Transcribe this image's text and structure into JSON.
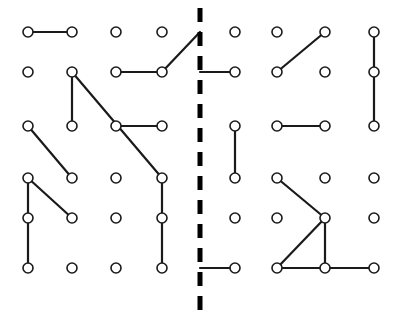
{
  "canvas": {
    "width": 397,
    "height": 318,
    "background": "#ffffff",
    "title": "Node Grid Diagram"
  },
  "style": {
    "node_fill": "#ffffff",
    "node_stroke": "#1a1a1a",
    "node_radius": 5,
    "node_stroke_width": 1.6,
    "edge_stroke": "#1a1a1a",
    "edge_stroke_width": 2.2,
    "divider_stroke": "#000000",
    "divider_stroke_width": 5,
    "divider_dash": "14 10"
  },
  "grid": {
    "columns_x": [
      28,
      72,
      116,
      162,
      235,
      277,
      325,
      374
    ],
    "rows_y": [
      32,
      72,
      126,
      178,
      218,
      268
    ],
    "column_count": 8,
    "row_count": 6
  },
  "divider": {
    "name": "vertical-dashed-divider",
    "x": 200,
    "y_top": 8,
    "y_bottom": 310,
    "orientation": "vertical",
    "style": "dashed"
  },
  "nodes": [
    {
      "id": "r1c1",
      "col": 0,
      "row": 0,
      "x": 28,
      "y": 32
    },
    {
      "id": "r1c2",
      "col": 1,
      "row": 0,
      "x": 72,
      "y": 32
    },
    {
      "id": "r1c3",
      "col": 2,
      "row": 0,
      "x": 116,
      "y": 32
    },
    {
      "id": "r1c4",
      "col": 3,
      "row": 0,
      "x": 162,
      "y": 32
    },
    {
      "id": "r1c5",
      "col": 4,
      "row": 0,
      "x": 235,
      "y": 32
    },
    {
      "id": "r1c6",
      "col": 5,
      "row": 0,
      "x": 277,
      "y": 32
    },
    {
      "id": "r1c7",
      "col": 6,
      "row": 0,
      "x": 325,
      "y": 32
    },
    {
      "id": "r1c8",
      "col": 7,
      "row": 0,
      "x": 374,
      "y": 32
    },
    {
      "id": "r2c1",
      "col": 0,
      "row": 1,
      "x": 28,
      "y": 72
    },
    {
      "id": "r2c2",
      "col": 1,
      "row": 1,
      "x": 72,
      "y": 72
    },
    {
      "id": "r2c3",
      "col": 2,
      "row": 1,
      "x": 116,
      "y": 72
    },
    {
      "id": "r2c4",
      "col": 3,
      "row": 1,
      "x": 162,
      "y": 72
    },
    {
      "id": "r2c5",
      "col": 4,
      "row": 1,
      "x": 235,
      "y": 72
    },
    {
      "id": "r2c6",
      "col": 5,
      "row": 1,
      "x": 277,
      "y": 72
    },
    {
      "id": "r2c7",
      "col": 6,
      "row": 1,
      "x": 325,
      "y": 72
    },
    {
      "id": "r2c8",
      "col": 7,
      "row": 1,
      "x": 374,
      "y": 72
    },
    {
      "id": "r3c1",
      "col": 0,
      "row": 2,
      "x": 28,
      "y": 126
    },
    {
      "id": "r3c2",
      "col": 1,
      "row": 2,
      "x": 72,
      "y": 126
    },
    {
      "id": "r3c3",
      "col": 2,
      "row": 2,
      "x": 116,
      "y": 126
    },
    {
      "id": "r3c4",
      "col": 3,
      "row": 2,
      "x": 162,
      "y": 126
    },
    {
      "id": "r3c5",
      "col": 4,
      "row": 2,
      "x": 235,
      "y": 126
    },
    {
      "id": "r3c6",
      "col": 5,
      "row": 2,
      "x": 277,
      "y": 126
    },
    {
      "id": "r3c7",
      "col": 6,
      "row": 2,
      "x": 325,
      "y": 126
    },
    {
      "id": "r3c8",
      "col": 7,
      "row": 2,
      "x": 374,
      "y": 126
    },
    {
      "id": "r4c1",
      "col": 0,
      "row": 3,
      "x": 28,
      "y": 178
    },
    {
      "id": "r4c2",
      "col": 1,
      "row": 3,
      "x": 72,
      "y": 178
    },
    {
      "id": "r4c3",
      "col": 2,
      "row": 3,
      "x": 116,
      "y": 178
    },
    {
      "id": "r4c4",
      "col": 3,
      "row": 3,
      "x": 162,
      "y": 178
    },
    {
      "id": "r4c5",
      "col": 4,
      "row": 3,
      "x": 235,
      "y": 178
    },
    {
      "id": "r4c6",
      "col": 5,
      "row": 3,
      "x": 277,
      "y": 178
    },
    {
      "id": "r4c7",
      "col": 6,
      "row": 3,
      "x": 325,
      "y": 178
    },
    {
      "id": "r4c8",
      "col": 7,
      "row": 3,
      "x": 374,
      "y": 178
    },
    {
      "id": "r5c1",
      "col": 0,
      "row": 4,
      "x": 28,
      "y": 218
    },
    {
      "id": "r5c2",
      "col": 1,
      "row": 4,
      "x": 72,
      "y": 218
    },
    {
      "id": "r5c3",
      "col": 2,
      "row": 4,
      "x": 116,
      "y": 218
    },
    {
      "id": "r5c4",
      "col": 3,
      "row": 4,
      "x": 162,
      "y": 218
    },
    {
      "id": "r5c5",
      "col": 4,
      "row": 4,
      "x": 235,
      "y": 218
    },
    {
      "id": "r5c6",
      "col": 5,
      "row": 4,
      "x": 277,
      "y": 218
    },
    {
      "id": "r5c7",
      "col": 6,
      "row": 4,
      "x": 325,
      "y": 218
    },
    {
      "id": "r5c8",
      "col": 7,
      "row": 4,
      "x": 374,
      "y": 218
    },
    {
      "id": "r6c1",
      "col": 0,
      "row": 5,
      "x": 28,
      "y": 268
    },
    {
      "id": "r6c2",
      "col": 1,
      "row": 5,
      "x": 72,
      "y": 268
    },
    {
      "id": "r6c3",
      "col": 2,
      "row": 5,
      "x": 116,
      "y": 268
    },
    {
      "id": "r6c4",
      "col": 3,
      "row": 5,
      "x": 162,
      "y": 268
    },
    {
      "id": "r6c5",
      "col": 4,
      "row": 5,
      "x": 235,
      "y": 268
    },
    {
      "id": "r6c6",
      "col": 5,
      "row": 5,
      "x": 277,
      "y": 268
    },
    {
      "id": "r6c7",
      "col": 6,
      "row": 5,
      "x": 325,
      "y": 268
    },
    {
      "id": "r6c8",
      "col": 7,
      "row": 5,
      "x": 374,
      "y": 268
    }
  ],
  "edges": [
    {
      "id": "e1",
      "from": "r1c1",
      "to": "r1c2",
      "x1": 28,
      "y1": 32,
      "x2": 72,
      "y2": 32,
      "kind": "horizontal"
    },
    {
      "id": "e2",
      "from": "r2c3",
      "to": "r2c4",
      "x1": 116,
      "y1": 72,
      "x2": 162,
      "y2": 72,
      "kind": "horizontal"
    },
    {
      "id": "e3",
      "from": "r2c4",
      "to": "divider",
      "x1": 162,
      "y1": 72,
      "x2": 200,
      "y2": 32,
      "kind": "diagonal-up"
    },
    {
      "id": "e4",
      "from": "divider",
      "to": "r2c5",
      "x1": 200,
      "y1": 72,
      "x2": 235,
      "y2": 72,
      "kind": "horizontal"
    },
    {
      "id": "e5",
      "from": "r1c7",
      "to": "r2c6",
      "x1": 325,
      "y1": 32,
      "x2": 277,
      "y2": 72,
      "kind": "diagonal-down"
    },
    {
      "id": "e6",
      "from": "r1c8",
      "to": "r2c8",
      "x1": 374,
      "y1": 32,
      "x2": 374,
      "y2": 72,
      "kind": "vertical"
    },
    {
      "id": "e7",
      "from": "r2c8",
      "to": "r3c8",
      "x1": 374,
      "y1": 72,
      "x2": 374,
      "y2": 126,
      "kind": "vertical"
    },
    {
      "id": "e8",
      "from": "r2c2",
      "to": "r3c2",
      "x1": 72,
      "y1": 72,
      "x2": 72,
      "y2": 126,
      "kind": "vertical"
    },
    {
      "id": "e9",
      "from": "r2c2",
      "to": "r4c4",
      "x1": 72,
      "y1": 72,
      "x2": 162,
      "y2": 178,
      "kind": "diagonal-down-long"
    },
    {
      "id": "e10",
      "from": "r3c3",
      "to": "r3c4",
      "x1": 116,
      "y1": 126,
      "x2": 162,
      "y2": 126,
      "kind": "horizontal"
    },
    {
      "id": "e11",
      "from": "r3c1",
      "to": "r4c2",
      "x1": 28,
      "y1": 126,
      "x2": 72,
      "y2": 178,
      "kind": "diagonal-down"
    },
    {
      "id": "e12",
      "from": "r3c5",
      "to": "r4c5",
      "x1": 235,
      "y1": 126,
      "x2": 235,
      "y2": 178,
      "kind": "vertical"
    },
    {
      "id": "e13",
      "from": "r3c6",
      "to": "r3c7",
      "x1": 277,
      "y1": 126,
      "x2": 325,
      "y2": 126,
      "kind": "horizontal"
    },
    {
      "id": "e14",
      "from": "r4c1",
      "to": "r5c2",
      "x1": 28,
      "y1": 178,
      "x2": 72,
      "y2": 218,
      "kind": "diagonal-down"
    },
    {
      "id": "e15",
      "from": "r4c1",
      "to": "r5c1",
      "x1": 28,
      "y1": 178,
      "x2": 28,
      "y2": 218,
      "kind": "vertical"
    },
    {
      "id": "e16",
      "from": "r5c1",
      "to": "r6c1",
      "x1": 28,
      "y1": 218,
      "x2": 28,
      "y2": 268,
      "kind": "vertical"
    },
    {
      "id": "e17",
      "from": "r4c4",
      "to": "r6c4",
      "x1": 162,
      "y1": 178,
      "x2": 162,
      "y2": 268,
      "kind": "vertical"
    },
    {
      "id": "e18",
      "from": "r4c6",
      "to": "r5c7",
      "x1": 277,
      "y1": 178,
      "x2": 325,
      "y2": 218,
      "kind": "diagonal-down"
    },
    {
      "id": "e19",
      "from": "r5c7",
      "to": "r6c7",
      "x1": 325,
      "y1": 218,
      "x2": 325,
      "y2": 268,
      "kind": "vertical"
    },
    {
      "id": "e20",
      "from": "divider",
      "to": "r6c5",
      "x1": 200,
      "y1": 268,
      "x2": 235,
      "y2": 268,
      "kind": "horizontal"
    },
    {
      "id": "e21",
      "from": "r6c6",
      "to": "r5c7",
      "x1": 277,
      "y1": 268,
      "x2": 325,
      "y2": 218,
      "kind": "diagonal-up"
    },
    {
      "id": "e22",
      "from": "r6c6",
      "to": "r6c7",
      "x1": 277,
      "y1": 268,
      "x2": 325,
      "y2": 268,
      "kind": "horizontal"
    },
    {
      "id": "e23",
      "from": "r6c7",
      "to": "r6c8",
      "x1": 325,
      "y1": 268,
      "x2": 374,
      "y2": 268,
      "kind": "horizontal"
    }
  ]
}
